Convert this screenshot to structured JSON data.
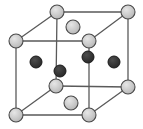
{
  "figure": {
    "kind": "crystal-unit-cell-diagram",
    "width": 143,
    "height": 129,
    "background_color": "#ffffff"
  },
  "style": {
    "edge_color": "#5a5a5a",
    "edge_width": 1.3,
    "light_atom_fill": "#c9c9c9",
    "light_atom_stroke": "#4a4a4a",
    "light_atom_stroke_width": 1.1,
    "light_atom_radius": 7,
    "light_atom_highlight": "#e2e2e2",
    "dark_atom_fill": "#333333",
    "dark_atom_stroke": "#1a1a1a",
    "dark_atom_stroke_width": 1,
    "dark_atom_radius": 6,
    "dark_atom_highlight": "#4f4f4f"
  },
  "geometry": {
    "front_face": {
      "top_left": [
        16,
        41
      ],
      "top_right": [
        89,
        41
      ],
      "bottom_right": [
        89,
        115
      ],
      "bottom_left": [
        16,
        115
      ]
    },
    "back_face": {
      "top_left": [
        57,
        12
      ],
      "top_right": [
        128,
        12
      ],
      "bottom_right": [
        128,
        87
      ],
      "bottom_left": [
        56,
        86
      ]
    },
    "edges": [
      {
        "name": "front-top",
        "from": [
          16,
          41
        ],
        "to": [
          89,
          41
        ]
      },
      {
        "name": "front-right",
        "from": [
          89,
          41
        ],
        "to": [
          89,
          115
        ]
      },
      {
        "name": "front-bottom",
        "from": [
          16,
          115
        ],
        "to": [
          89,
          115
        ]
      },
      {
        "name": "front-left",
        "from": [
          16,
          41
        ],
        "to": [
          16,
          115
        ]
      },
      {
        "name": "back-top",
        "from": [
          57,
          12
        ],
        "to": [
          128,
          12
        ]
      },
      {
        "name": "back-right",
        "from": [
          128,
          12
        ],
        "to": [
          128,
          87
        ]
      },
      {
        "name": "back-bottom",
        "from": [
          56,
          86
        ],
        "to": [
          128,
          87
        ]
      },
      {
        "name": "back-left",
        "from": [
          57,
          12
        ],
        "to": [
          56,
          86
        ]
      },
      {
        "name": "connector-top-left",
        "from": [
          16,
          41
        ],
        "to": [
          57,
          12
        ]
      },
      {
        "name": "connector-top-right",
        "from": [
          89,
          41
        ],
        "to": [
          128,
          12
        ]
      },
      {
        "name": "connector-bottom-left",
        "from": [
          16,
          115
        ],
        "to": [
          56,
          86
        ]
      },
      {
        "name": "connector-bottom-right",
        "from": [
          89,
          115
        ],
        "to": [
          128,
          87
        ]
      }
    ]
  },
  "atoms": {
    "light": [
      {
        "id": "corner-front-top-left",
        "cx": 16,
        "cy": 41
      },
      {
        "id": "corner-front-top-right",
        "cx": 89,
        "cy": 41
      },
      {
        "id": "corner-front-bottom-left",
        "cx": 16,
        "cy": 115
      },
      {
        "id": "corner-front-bottom-right",
        "cx": 89,
        "cy": 115
      },
      {
        "id": "corner-back-top-left",
        "cx": 57,
        "cy": 12
      },
      {
        "id": "corner-back-top-right",
        "cx": 128,
        "cy": 12
      },
      {
        "id": "corner-back-bottom-left",
        "cx": 56,
        "cy": 86
      },
      {
        "id": "corner-back-bottom-right",
        "cx": 128,
        "cy": 87
      },
      {
        "id": "face-center-top",
        "cx": 73,
        "cy": 27
      },
      {
        "id": "face-center-bottom",
        "cx": 71,
        "cy": 103
      }
    ],
    "dark": [
      {
        "id": "interior-left",
        "cx": 36,
        "cy": 62
      },
      {
        "id": "interior-lower-middle",
        "cx": 60,
        "cy": 71
      },
      {
        "id": "interior-upper-middle",
        "cx": 88,
        "cy": 57
      },
      {
        "id": "interior-right",
        "cx": 114,
        "cy": 62
      }
    ]
  },
  "counts": {
    "light_atoms": 10,
    "dark_atoms": 4,
    "edges": 12
  }
}
